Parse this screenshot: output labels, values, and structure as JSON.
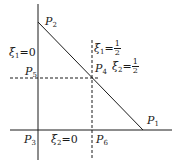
{
  "diagram": {
    "points": {
      "P1": {
        "name": "P",
        "sub": "1"
      },
      "P2": {
        "name": "P",
        "sub": "2"
      },
      "P3": {
        "name": "P",
        "sub": "3"
      },
      "P4": {
        "name": "P",
        "sub": "4"
      },
      "P5": {
        "name": "P",
        "sub": "5"
      },
      "P6": {
        "name": "P",
        "sub": "6"
      }
    },
    "labels": {
      "xi1_zero": {
        "var": "ξ",
        "sub": "1",
        "eq": "=0"
      },
      "xi2_zero": {
        "var": "ξ",
        "sub": "2",
        "eq": "=0"
      },
      "xi1_half": {
        "var": "ξ",
        "sub": "1",
        "eq": "=",
        "num": "1",
        "den": "2"
      },
      "xi2_half": {
        "var": "ξ",
        "sub": "2",
        "eq": "=",
        "num": "1",
        "den": "2"
      }
    },
    "colors": {
      "line": "#1a1a1a",
      "background": "#ffffff"
    }
  }
}
